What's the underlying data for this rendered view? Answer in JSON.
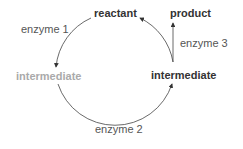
{
  "diagram": {
    "nodes": {
      "reactant": "reactant",
      "product": "product",
      "intermediate_left": "intermediate",
      "intermediate_right": "intermediate"
    },
    "enzymes": {
      "enzyme1": "enzyme 1",
      "enzyme2": "enzyme 2",
      "enzyme3": "enzyme 3"
    },
    "colors": {
      "text": "#333333",
      "faded": "#aaaaaa",
      "arrow": "#333333"
    }
  }
}
